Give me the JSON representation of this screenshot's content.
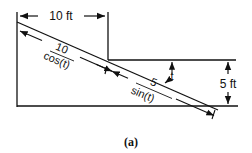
{
  "diagram": {
    "caption": "(a)",
    "width_label": "10 ft",
    "height_label": "5 ft",
    "angle_label": "t",
    "segment_upper": {
      "numerator": "10",
      "denominator": "cos(t)"
    },
    "segment_lower": {
      "numerator": "5",
      "denominator": "sin(t)"
    },
    "colors": {
      "line": "#111111",
      "background": "#ffffff"
    }
  }
}
